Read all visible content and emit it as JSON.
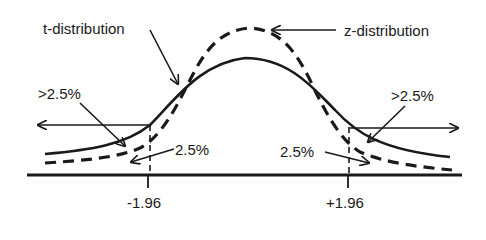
{
  "diagram": {
    "labels": {
      "t_distribution": "t-distribution",
      "z_distribution": "z-distribution",
      "left_tail_t": ">2.5%",
      "right_tail_t": ">2.5%",
      "left_tail_z": "2.5%",
      "right_tail_z": "2.5%",
      "left_critical": "-1.96",
      "right_critical": "+1.96"
    },
    "colors": {
      "ink": "#1a1a1a",
      "background": "#ffffff"
    },
    "curves": [
      {
        "name": "t-distribution",
        "style": "solid",
        "peak_relative_height": 0.78
      },
      {
        "name": "z-distribution",
        "style": "dashed",
        "peak_relative_height": 1.0
      }
    ],
    "critical_values": [
      -1.96,
      1.96
    ]
  }
}
